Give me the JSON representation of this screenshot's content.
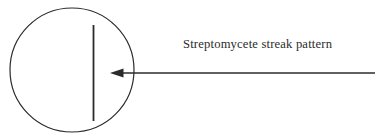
{
  "figure": {
    "name": "streptomycete-streak-pattern-diagram",
    "width": 378,
    "height": 139,
    "background_color": "#ffffff",
    "stroke_color": "#2b2b2b",
    "text_color": "#2b2b2b"
  },
  "annotation": {
    "label": "Streptomycete streak pattern",
    "text_left": 183,
    "text_top": 36,
    "font_size": 12.6
  },
  "petri_dish": {
    "icon": "circle-outline-icon",
    "center_x": 72,
    "center_y": 70,
    "radius": 62,
    "stroke_width": 1.2,
    "fill": "none"
  },
  "streak": {
    "icon": "vertical-line-icon",
    "x": 93.5,
    "y_top": 25,
    "y_bottom": 121,
    "stroke_width": 1.8
  },
  "pointer_arrow": {
    "icon": "left-arrow-icon",
    "y": 73,
    "tail_x": 375,
    "tip_x": 110,
    "head_base_x": 123,
    "head_half_height": 4,
    "stroke_width": 1.3
  }
}
